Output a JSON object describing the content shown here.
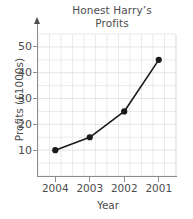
{
  "chart_data": {
    "type": "line",
    "title": "Honest Harry’s\nProfits",
    "title_line1": "Honest Harry’s",
    "title_line2": "Profits",
    "xlabel": "Year",
    "ylabel": "Profits (£1000s)",
    "categories": [
      "2004",
      "2003",
      "2002",
      "2001"
    ],
    "values": [
      10,
      15,
      25,
      45
    ],
    "series": [
      {
        "name": "Profits",
        "values": [
          10,
          15,
          25,
          45
        ],
        "line_color": "#1a1a1a",
        "marker": "circle",
        "marker_color": "#1a1a1a"
      }
    ],
    "ylim": [
      0,
      55
    ],
    "yticks": [
      10,
      20,
      30,
      40,
      50
    ],
    "ytick_labels": [
      "10",
      "20",
      "30",
      "40",
      "50"
    ],
    "xtick_labels": [
      "2004",
      "2003",
      "2002",
      "2001"
    ],
    "grid": true,
    "grid_color": "#dcdce4",
    "minor_grid": true,
    "minor_grid_divisions": 3,
    "legend": false,
    "axis_color": "#8c8c8c",
    "text_color": "#4d4d4d",
    "background": "#ffffff",
    "y_axis_arrow": true,
    "annotations": []
  }
}
